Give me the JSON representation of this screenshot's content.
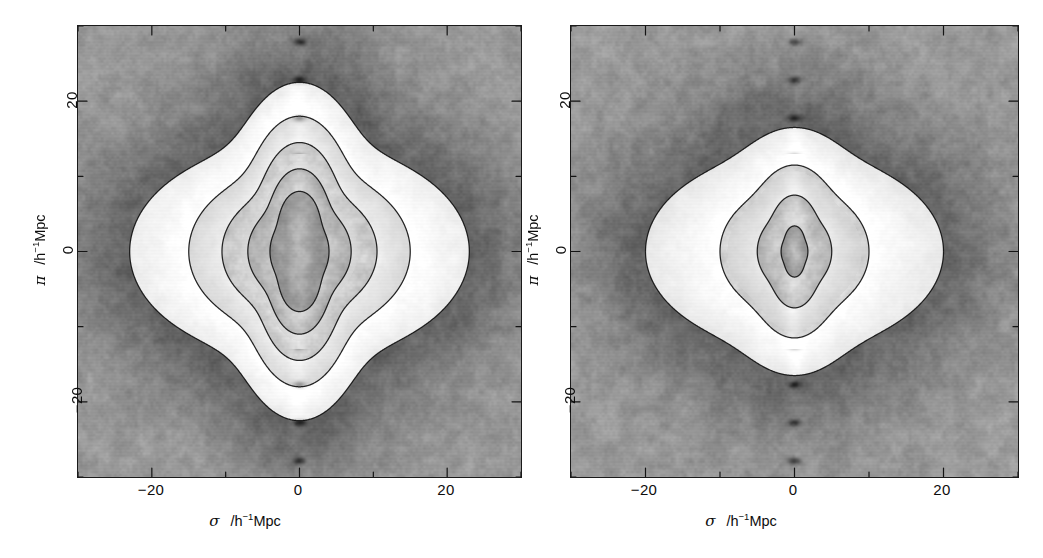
{
  "figure": {
    "background_color": "#ffffff",
    "frame_color": "#1a1a1a",
    "map_low_color": "#3a3a3a",
    "map_mid_color": "#9a9a9a",
    "map_high_color": "#ffffff"
  },
  "panels": [
    {
      "id": "left-panel",
      "name": "left",
      "xaxis": {
        "label_symbol": "σ",
        "label_units_pre": "/h",
        "label_units_sup": "−1",
        "label_units_post": "Mpc",
        "ticks": [
          "−20",
          "0",
          "20"
        ],
        "tick_values": [
          -20,
          0,
          20
        ],
        "range": [
          -30,
          30
        ]
      },
      "yaxis": {
        "label_symbol": "π",
        "label_units_pre": "/h",
        "label_units_sup": "−1",
        "label_units_post": "Mpc",
        "ticks": [
          "−20",
          "0",
          "20"
        ],
        "tick_values": [
          -20,
          0,
          20
        ],
        "range": [
          -30,
          30
        ]
      }
    },
    {
      "id": "right-panel",
      "name": "right",
      "xaxis": {
        "label_symbol": "σ",
        "label_units_pre": "/h",
        "label_units_sup": "−1",
        "label_units_post": "Mpc",
        "ticks": [
          "−20",
          "0",
          "20"
        ],
        "tick_values": [
          -20,
          0,
          20
        ],
        "range": [
          -30,
          30
        ]
      },
      "yaxis": {
        "label_symbol": "π",
        "label_units_pre": "/h",
        "label_units_sup": "−1",
        "label_units_post": "Mpc",
        "ticks": [
          "−20",
          "0",
          "20"
        ],
        "tick_values": [
          -20,
          0,
          20
        ],
        "range": [
          -30,
          30
        ]
      }
    }
  ],
  "chart_data": [
    {
      "type": "heatmap",
      "panel": "left",
      "title": "",
      "xlabel": "σ  /h⁻¹Mpc",
      "ylabel": "π  /h⁻¹Mpc",
      "xlim": [
        -30,
        30
      ],
      "ylim": [
        -30,
        30
      ],
      "xticks": [
        -20,
        0,
        20
      ],
      "yticks": [
        -20,
        0,
        20
      ],
      "grid": false,
      "legend": "none",
      "colormap": "greyscale",
      "quantity": "ξ(σ,π) redshift-space correlation function",
      "peak_location": [
        0,
        0
      ],
      "peak_is_brightest": true,
      "elongation_axis": "pi",
      "elongation_ratio": 1.9,
      "finger_of_god": true,
      "contour_count": 5,
      "contours": [
        {
          "index": 1,
          "sigma_extent": 23.0,
          "pi_extent": 14.5,
          "cusp_pi": 22.5,
          "cusp_sharpness": 0.92
        },
        {
          "index": 2,
          "sigma_extent": 15.0,
          "pi_extent": 11.0,
          "cusp_pi": 18.0,
          "cusp_sharpness": 0.88
        },
        {
          "index": 3,
          "sigma_extent": 10.5,
          "pi_extent": 8.5,
          "cusp_pi": 14.5,
          "cusp_sharpness": 0.84
        },
        {
          "index": 4,
          "sigma_extent": 7.0,
          "pi_extent": 6.5,
          "cusp_pi": 11.0,
          "cusp_sharpness": 0.8
        },
        {
          "index": 5,
          "sigma_extent": 4.0,
          "pi_extent": 4.8,
          "cusp_pi": 8.0,
          "cusp_sharpness": 0.74
        }
      ]
    },
    {
      "type": "heatmap",
      "panel": "right",
      "title": "",
      "xlabel": "σ  /h⁻¹Mpc",
      "ylabel": "π  /h⁻¹Mpc",
      "xlim": [
        -30,
        30
      ],
      "ylim": [
        -30,
        30
      ],
      "xticks": [
        -20,
        0,
        20
      ],
      "yticks": [
        -20,
        0,
        20
      ],
      "grid": false,
      "legend": "none",
      "colormap": "greyscale",
      "quantity": "ξ(σ,π) redshift-space correlation function",
      "peak_location": [
        0,
        0
      ],
      "peak_is_brightest": true,
      "elongation_axis": "pi",
      "elongation_ratio": 1.35,
      "finger_of_god": true,
      "contour_count": 4,
      "contours": [
        {
          "index": 1,
          "sigma_extent": 20.0,
          "pi_extent": 13.0,
          "cusp_pi": 16.5,
          "cusp_sharpness": 0.7
        },
        {
          "index": 2,
          "sigma_extent": 10.0,
          "pi_extent": 8.5,
          "cusp_pi": 11.5,
          "cusp_sharpness": 0.78
        },
        {
          "index": 3,
          "sigma_extent": 5.0,
          "pi_extent": 5.2,
          "cusp_pi": 7.5,
          "cusp_sharpness": 0.8
        },
        {
          "index": 4,
          "sigma_extent": 1.8,
          "pi_extent": 2.4,
          "cusp_pi": 3.4,
          "cusp_sharpness": 0.78
        }
      ]
    }
  ]
}
